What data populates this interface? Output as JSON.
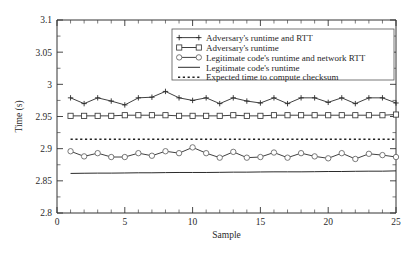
{
  "chart_data": {
    "type": "line",
    "title": "",
    "xlabel": "Sample",
    "ylabel": "Time (s)",
    "xlim": [
      0,
      25
    ],
    "ylim": [
      2.8,
      3.1
    ],
    "xticks": [
      0,
      5,
      10,
      15,
      20,
      25
    ],
    "xtick_labels": [
      "0",
      "5",
      "10",
      "15",
      "20",
      "25"
    ],
    "yticks": [
      2.8,
      2.85,
      2.9,
      2.95,
      3.0,
      3.05,
      3.1
    ],
    "ytick_labels": [
      "2.8",
      "2.85",
      "2.9",
      "2.95",
      "3",
      "3.05",
      "3.1"
    ],
    "grid": false,
    "legend_position": "top-right",
    "x": [
      1,
      2,
      3,
      4,
      5,
      6,
      7,
      8,
      9,
      10,
      11,
      12,
      13,
      14,
      15,
      16,
      17,
      18,
      19,
      20,
      21,
      22,
      23,
      24,
      25
    ],
    "series": [
      {
        "name": "Adversary's runtime and RTT",
        "marker": "plus",
        "style": "solid",
        "values": [
          2.979,
          2.97,
          2.979,
          2.974,
          2.968,
          2.979,
          2.98,
          2.989,
          2.979,
          2.975,
          2.979,
          2.97,
          2.979,
          2.974,
          2.971,
          2.979,
          2.97,
          2.979,
          2.979,
          2.972,
          2.979,
          2.97,
          2.979,
          2.979,
          2.971
        ]
      },
      {
        "name": "Adversary's runtime",
        "marker": "square",
        "style": "solid",
        "values": [
          2.951,
          2.951,
          2.951,
          2.951,
          2.952,
          2.952,
          2.952,
          2.952,
          2.951,
          2.951,
          2.951,
          2.951,
          2.952,
          2.951,
          2.951,
          2.952,
          2.952,
          2.952,
          2.952,
          2.952,
          2.952,
          2.952,
          2.952,
          2.952,
          2.953
        ]
      },
      {
        "name": "Legitimate code's runtime and network RTT",
        "marker": "circle",
        "style": "solid",
        "values": [
          2.896,
          2.888,
          2.893,
          2.887,
          2.887,
          2.893,
          2.889,
          2.896,
          2.893,
          2.902,
          2.893,
          2.886,
          2.895,
          2.886,
          2.887,
          2.894,
          2.886,
          2.893,
          2.888,
          2.885,
          2.893,
          2.884,
          2.892,
          2.89,
          2.887
        ]
      },
      {
        "name": "Legitimate code's runtime",
        "marker": "none",
        "style": "solid",
        "values": [
          2.8615,
          2.8618,
          2.862,
          2.862,
          2.8622,
          2.8625,
          2.8625,
          2.8628,
          2.863,
          2.863,
          2.863,
          2.8632,
          2.8635,
          2.8635,
          2.8638,
          2.864,
          2.864,
          2.864,
          2.8642,
          2.8645,
          2.8645,
          2.8648,
          2.865,
          2.865,
          2.8655
        ]
      },
      {
        "name": "Expected time to compute checksum",
        "marker": "none",
        "style": "dotted",
        "values": [
          2.9145,
          2.9145,
          2.9145,
          2.9145,
          2.9145,
          2.9145,
          2.9145,
          2.9145,
          2.9145,
          2.9145,
          2.9145,
          2.9145,
          2.9145,
          2.9145,
          2.9145,
          2.9145,
          2.9145,
          2.9145,
          2.9145,
          2.9145,
          2.9145,
          2.9145,
          2.9145,
          2.9145,
          2.9145
        ]
      }
    ]
  },
  "legend": {
    "entries": [
      "Adversary's runtime and RTT",
      "Adversary's runtime",
      "Legitimate code's runtime and network RTT",
      "Legitimate code's runtime",
      "Expected time to compute checksum"
    ]
  },
  "colors": {
    "line": "#2b2b2b",
    "axis": "#333333",
    "background": "#ffffff"
  }
}
